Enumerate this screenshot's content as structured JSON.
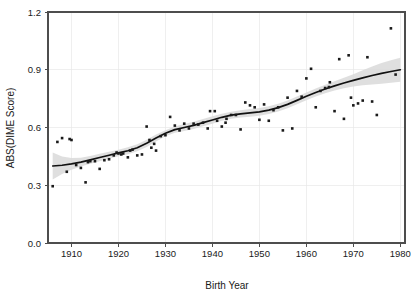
{
  "chart_data": {
    "type": "scatter",
    "title": "",
    "subtitle": "",
    "xlabel": "Birth Year",
    "ylabel": "ABS(DIME Score)",
    "xlim": [
      1905,
      1981
    ],
    "ylim": [
      0.0,
      1.2
    ],
    "xticks": [
      1910,
      1920,
      1930,
      1940,
      1950,
      1960,
      1970,
      1980
    ],
    "xtick_labels": [
      "1910",
      "1920",
      "1930",
      "1940",
      "1950",
      "1960",
      "1970",
      "1980"
    ],
    "yticks": [
      0.0,
      0.3,
      0.6,
      0.9,
      1.2
    ],
    "ytick_labels": [
      "0.0",
      "0.3",
      "0.6",
      "0.9",
      "1.2"
    ],
    "grid": true,
    "legend": "none",
    "point_color": "#1a1a1a",
    "line_color": "#111111",
    "band_color": "#d9d9d9",
    "frame_color": "#4d4d4d",
    "grid_color": "#e8e8e8",
    "series": [
      {
        "name": "ABS(DIME Score) by Birth Year",
        "points": [
          [
            1906,
            0.295
          ],
          [
            1907,
            0.525
          ],
          [
            1908,
            0.545
          ],
          [
            1909,
            0.37
          ],
          [
            1909.6,
            0.54
          ],
          [
            1910,
            0.535
          ],
          [
            1911,
            0.405
          ],
          [
            1912,
            0.39
          ],
          [
            1913,
            0.315
          ],
          [
            1913.5,
            0.42
          ],
          [
            1914,
            0.425
          ],
          [
            1915,
            0.425
          ],
          [
            1916,
            0.385
          ],
          [
            1917,
            0.43
          ],
          [
            1918,
            0.435
          ],
          [
            1919,
            0.455
          ],
          [
            1919.6,
            0.47
          ],
          [
            1920,
            0.465
          ],
          [
            1920.6,
            0.46
          ],
          [
            1921,
            0.465
          ],
          [
            1922,
            0.445
          ],
          [
            1922.5,
            0.48
          ],
          [
            1923,
            0.485
          ],
          [
            1924,
            0.455
          ],
          [
            1925,
            0.46
          ],
          [
            1926,
            0.605
          ],
          [
            1926.6,
            0.535
          ],
          [
            1927,
            0.495
          ],
          [
            1927.6,
            0.515
          ],
          [
            1928,
            0.48
          ],
          [
            1929,
            0.555
          ],
          [
            1930,
            0.56
          ],
          [
            1931,
            0.655
          ],
          [
            1932,
            0.61
          ],
          [
            1933,
            0.585
          ],
          [
            1934,
            0.62
          ],
          [
            1935,
            0.595
          ],
          [
            1936,
            0.62
          ],
          [
            1937,
            0.615
          ],
          [
            1938,
            0.625
          ],
          [
            1939,
            0.595
          ],
          [
            1939.5,
            0.685
          ],
          [
            1940.5,
            0.685
          ],
          [
            1941,
            0.635
          ],
          [
            1942,
            0.605
          ],
          [
            1942.8,
            0.625
          ],
          [
            1943,
            0.645
          ],
          [
            1944,
            0.665
          ],
          [
            1945,
            0.665
          ],
          [
            1946,
            0.59
          ],
          [
            1947,
            0.73
          ],
          [
            1948,
            0.715
          ],
          [
            1949,
            0.705
          ],
          [
            1950,
            0.64
          ],
          [
            1951,
            0.72
          ],
          [
            1952,
            0.635
          ],
          [
            1953,
            0.69
          ],
          [
            1954,
            0.705
          ],
          [
            1955,
            0.585
          ],
          [
            1956,
            0.755
          ],
          [
            1957,
            0.595
          ],
          [
            1958,
            0.79
          ],
          [
            1959,
            0.76
          ],
          [
            1960,
            0.855
          ],
          [
            1961,
            0.905
          ],
          [
            1962,
            0.705
          ],
          [
            1963,
            0.79
          ],
          [
            1964,
            0.805
          ],
          [
            1964.8,
            0.81
          ],
          [
            1965,
            0.835
          ],
          [
            1966,
            0.685
          ],
          [
            1967,
            0.955
          ],
          [
            1968,
            0.645
          ],
          [
            1969,
            0.975
          ],
          [
            1969.5,
            0.755
          ],
          [
            1970,
            0.715
          ],
          [
            1971,
            0.725
          ],
          [
            1972,
            0.74
          ],
          [
            1973,
            0.965
          ],
          [
            1974,
            0.735
          ],
          [
            1975,
            0.665
          ],
          [
            1978,
            1.115
          ],
          [
            1979,
            0.875
          ]
        ]
      }
    ],
    "fit": {
      "name": "loess-smoother",
      "points": [
        [
          1906,
          0.4
        ],
        [
          1908,
          0.404
        ],
        [
          1910,
          0.411
        ],
        [
          1912,
          0.42
        ],
        [
          1914,
          0.432
        ],
        [
          1916,
          0.444
        ],
        [
          1918,
          0.456
        ],
        [
          1920,
          0.468
        ],
        [
          1922,
          0.479
        ],
        [
          1924,
          0.495
        ],
        [
          1926,
          0.518
        ],
        [
          1928,
          0.545
        ],
        [
          1930,
          0.57
        ],
        [
          1932,
          0.589
        ],
        [
          1934,
          0.6
        ],
        [
          1936,
          0.611
        ],
        [
          1938,
          0.625
        ],
        [
          1940,
          0.639
        ],
        [
          1942,
          0.653
        ],
        [
          1944,
          0.664
        ],
        [
          1946,
          0.671
        ],
        [
          1948,
          0.676
        ],
        [
          1950,
          0.681
        ],
        [
          1952,
          0.69
        ],
        [
          1954,
          0.703
        ],
        [
          1956,
          0.72
        ],
        [
          1958,
          0.741
        ],
        [
          1960,
          0.762
        ],
        [
          1962,
          0.782
        ],
        [
          1964,
          0.8
        ],
        [
          1966,
          0.816
        ],
        [
          1968,
          0.831
        ],
        [
          1970,
          0.845
        ],
        [
          1972,
          0.858
        ],
        [
          1974,
          0.87
        ],
        [
          1976,
          0.881
        ],
        [
          1978,
          0.891
        ],
        [
          1980,
          0.9
        ]
      ],
      "band_upper": [
        [
          1906,
          0.47
        ],
        [
          1908,
          0.45
        ],
        [
          1910,
          0.441
        ],
        [
          1912,
          0.443
        ],
        [
          1914,
          0.452
        ],
        [
          1916,
          0.463
        ],
        [
          1918,
          0.474
        ],
        [
          1920,
          0.485
        ],
        [
          1922,
          0.497
        ],
        [
          1924,
          0.513
        ],
        [
          1926,
          0.537
        ],
        [
          1928,
          0.563
        ],
        [
          1930,
          0.586
        ],
        [
          1932,
          0.605
        ],
        [
          1934,
          0.618
        ],
        [
          1936,
          0.63
        ],
        [
          1938,
          0.644
        ],
        [
          1940,
          0.658
        ],
        [
          1942,
          0.671
        ],
        [
          1944,
          0.682
        ],
        [
          1946,
          0.69
        ],
        [
          1948,
          0.696
        ],
        [
          1950,
          0.701
        ],
        [
          1952,
          0.71
        ],
        [
          1954,
          0.723
        ],
        [
          1956,
          0.74
        ],
        [
          1958,
          0.761
        ],
        [
          1960,
          0.782
        ],
        [
          1962,
          0.803
        ],
        [
          1964,
          0.822
        ],
        [
          1966,
          0.84
        ],
        [
          1968,
          0.858
        ],
        [
          1970,
          0.877
        ],
        [
          1972,
          0.897
        ],
        [
          1974,
          0.917
        ],
        [
          1976,
          0.935
        ],
        [
          1978,
          0.95
        ],
        [
          1980,
          0.962
        ]
      ],
      "band_lower": [
        [
          1906,
          0.33
        ],
        [
          1908,
          0.358
        ],
        [
          1910,
          0.381
        ],
        [
          1912,
          0.397
        ],
        [
          1914,
          0.412
        ],
        [
          1916,
          0.425
        ],
        [
          1918,
          0.438
        ],
        [
          1920,
          0.451
        ],
        [
          1922,
          0.461
        ],
        [
          1924,
          0.477
        ],
        [
          1926,
          0.499
        ],
        [
          1928,
          0.527
        ],
        [
          1930,
          0.554
        ],
        [
          1932,
          0.573
        ],
        [
          1934,
          0.582
        ],
        [
          1936,
          0.592
        ],
        [
          1938,
          0.606
        ],
        [
          1940,
          0.62
        ],
        [
          1942,
          0.635
        ],
        [
          1944,
          0.646
        ],
        [
          1946,
          0.652
        ],
        [
          1948,
          0.656
        ],
        [
          1950,
          0.661
        ],
        [
          1952,
          0.67
        ],
        [
          1954,
          0.683
        ],
        [
          1956,
          0.7
        ],
        [
          1958,
          0.721
        ],
        [
          1960,
          0.742
        ],
        [
          1962,
          0.761
        ],
        [
          1964,
          0.778
        ],
        [
          1966,
          0.792
        ],
        [
          1968,
          0.804
        ],
        [
          1970,
          0.813
        ],
        [
          1972,
          0.819
        ],
        [
          1974,
          0.823
        ],
        [
          1976,
          0.827
        ],
        [
          1978,
          0.832
        ],
        [
          1980,
          0.838
        ]
      ]
    }
  }
}
